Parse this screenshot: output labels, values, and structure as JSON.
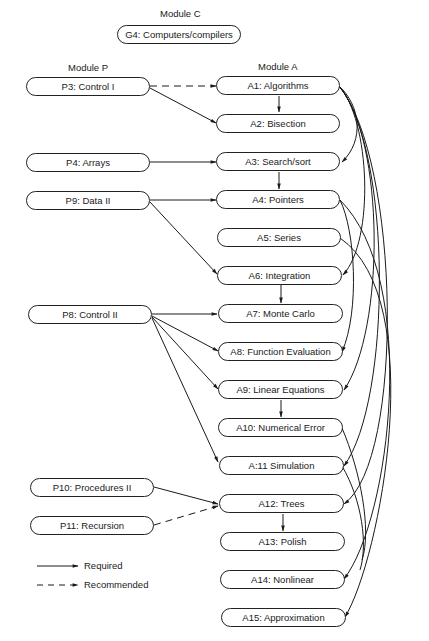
{
  "modules": {
    "c": {
      "title": "Module C"
    },
    "p": {
      "title": "Module P"
    },
    "a": {
      "title": "Module A"
    }
  },
  "nodes": {
    "G4": "G4:  Computers/compilers",
    "P3": "P3:  Control I",
    "P4": "P4:  Arrays",
    "P9": "P9:  Data II",
    "P8": "P8:  Control II",
    "P10": "P10:  Procedures II",
    "P11": "P11:  Recursion",
    "A1": "A1:  Algorithms",
    "A2": "A2:  Bisection",
    "A3": "A3:  Search/sort",
    "A4": "A4:  Pointers",
    "A5": "A5:  Series",
    "A6": "A6:  Integration",
    "A7": "A7:  Monte Carlo",
    "A8": "A8:  Function Evaluation",
    "A9": "A9:  Linear Equations",
    "A10": "A10:  Numerical Error",
    "A11": "A:11  Simulation",
    "A12": "A12:  Trees",
    "A13": "A13:  Polish",
    "A14": "A14:  Nonlinear",
    "A15": "A15:  Approximation"
  },
  "edges": [
    {
      "from": "P3",
      "to": "A1",
      "type": "recommended"
    },
    {
      "from": "P3",
      "to": "A2",
      "type": "required"
    },
    {
      "from": "A1",
      "to": "A2",
      "type": "required"
    },
    {
      "from": "P4",
      "to": "A3",
      "type": "required"
    },
    {
      "from": "A3",
      "to": "A4",
      "type": "required"
    },
    {
      "from": "P9",
      "to": "A4",
      "type": "required"
    },
    {
      "from": "P9",
      "to": "A6",
      "type": "required"
    },
    {
      "from": "A6",
      "to": "A7",
      "type": "required"
    },
    {
      "from": "P8",
      "to": "A7",
      "type": "required"
    },
    {
      "from": "P8",
      "to": "A8",
      "type": "required"
    },
    {
      "from": "P8",
      "to": "A9",
      "type": "required"
    },
    {
      "from": "P8",
      "to": "A11",
      "type": "required"
    },
    {
      "from": "A9",
      "to": "A10",
      "type": "required"
    },
    {
      "from": "P10",
      "to": "A12",
      "type": "required"
    },
    {
      "from": "P11",
      "to": "A12",
      "type": "recommended"
    },
    {
      "from": "A12",
      "to": "A13",
      "type": "required"
    },
    {
      "from": "A1",
      "to": "A3",
      "type": "required"
    },
    {
      "from": "A1",
      "to": "A6",
      "type": "required"
    },
    {
      "from": "A1",
      "to": "A9",
      "type": "required"
    },
    {
      "from": "A1",
      "to": "A11",
      "type": "required"
    },
    {
      "from": "A1",
      "to": "A12",
      "type": "required"
    },
    {
      "from": "A4",
      "to": "A8",
      "type": "required"
    },
    {
      "from": "A4",
      "to": "A14",
      "type": "required"
    },
    {
      "from": "A5",
      "to": "A15",
      "type": "required"
    }
  ],
  "legend": {
    "required": "Required",
    "recommended": "Recommended"
  }
}
